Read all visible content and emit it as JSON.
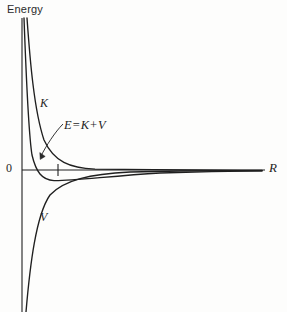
{
  "figure": {
    "name": "energy-vs-internuclear-distance",
    "background_color": "#fdfdfc",
    "line_color": "#1f1f1f",
    "width": 287,
    "height": 312
  },
  "axes": {
    "y_axis_title": "Energy",
    "x_axis_label": "R",
    "origin_label": "0",
    "x_tick_positions": [
      58
    ],
    "y_axis_x": 22,
    "x_axis_y": 170,
    "x_axis_end": 265,
    "y_axis_top": 18,
    "y_axis_bottom": 312
  },
  "labels": {
    "k_curve": "K",
    "v_curve": "V",
    "e_curve_lhs": "E",
    "e_curve_eq": "=",
    "e_curve_k": "K",
    "e_curve_plus": "+",
    "e_curve_v": "V"
  },
  "chart_data": {
    "type": "line",
    "title": "",
    "xlabel": "R",
    "ylabel": "Energy",
    "grid": false,
    "legend": "inline-curve-labels",
    "xlim": [
      0,
      1
    ],
    "ylim": [
      -1,
      1
    ],
    "annotations": [
      {
        "text": "K",
        "x": 0.09,
        "y": 0.42,
        "target": "kinetic-energy-curve"
      },
      {
        "text": "E = K + V",
        "x": 0.2,
        "y": 0.3,
        "target": "total-energy-curve",
        "leader": true
      },
      {
        "text": "V",
        "x": 0.09,
        "y": -0.3,
        "target": "potential-energy-curve"
      },
      {
        "text": "0",
        "x": 0.0,
        "y": 0.0,
        "target": "origin"
      },
      {
        "text": "R",
        "x": 1.0,
        "y": 0.0,
        "target": "x-axis-end"
      }
    ],
    "series": [
      {
        "name": "K",
        "description": "Kinetic energy: positive, diverges as R approaches 0, decays asymptotically to 0 from above",
        "path": "M 27,18 C 30,60 34,110 44,140 C 54,162 70,168 95,169.2 C 135,170 200,170.2 262,170.4",
        "x": [
          0.02,
          0.05,
          0.08,
          0.12,
          0.18,
          0.25,
          0.35,
          0.5,
          0.7,
          1.0
        ],
        "y": [
          1.0,
          0.72,
          0.48,
          0.3,
          0.17,
          0.1,
          0.05,
          0.02,
          0.008,
          0.0
        ]
      },
      {
        "name": "E = K + V",
        "description": "Total energy: diverges positive as R approaches 0, crosses zero, reaches a negative minimum (equilibrium), then rises asymptotically to 0 from below",
        "path": "M 24,18 C 26,70 28,130 32,155 C 36,172 42,180 54,180.6 C 72,181 110,176 160,173 C 200,171.6 235,171 262,170.8",
        "x": [
          0.01,
          0.03,
          0.05,
          0.08,
          0.12,
          0.18,
          0.25,
          0.4,
          0.6,
          0.8,
          1.0
        ],
        "y": [
          1.0,
          0.55,
          0.22,
          0.0,
          -0.1,
          -0.11,
          -0.09,
          -0.05,
          -0.025,
          -0.012,
          -0.005
        ]
      },
      {
        "name": "V",
        "description": "Potential energy: strongly negative, diverges to minus infinity as R approaches 0, rises asymptotically to 0 from below",
        "path": "M 26,312 C 30,265 36,215 50,195 C 64,180 90,174 130,172 C 180,170.8 225,170.6 262,170.9",
        "x": [
          0.02,
          0.05,
          0.09,
          0.14,
          0.2,
          0.3,
          0.45,
          0.6,
          0.8,
          1.0
        ],
        "y": [
          -1.0,
          -0.62,
          -0.35,
          -0.2,
          -0.13,
          -0.07,
          -0.035,
          -0.02,
          -0.01,
          -0.004
        ]
      }
    ]
  }
}
